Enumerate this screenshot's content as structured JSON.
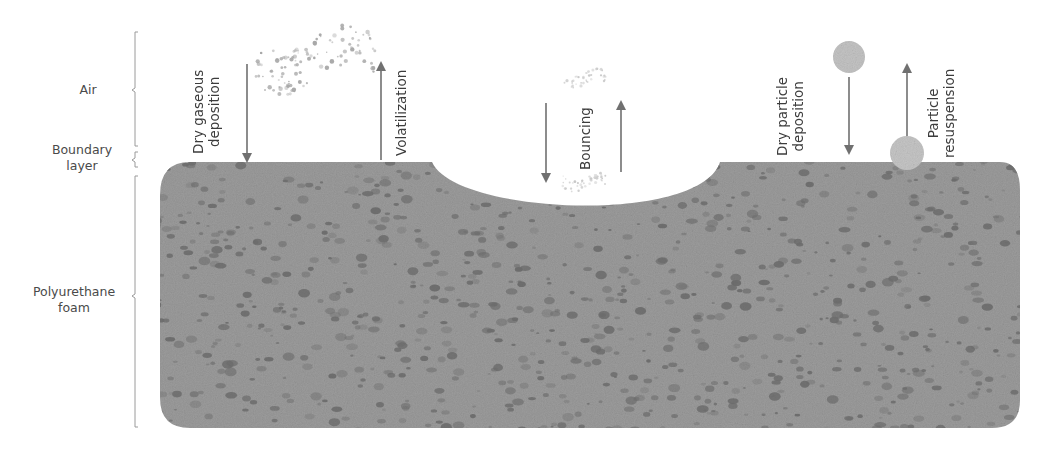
{
  "layers": [
    {
      "name": "air",
      "label": "Air"
    },
    {
      "name": "boundary-layer",
      "label": "Boundary\nlayer",
      "line1": "Boundary",
      "line2": "layer"
    },
    {
      "name": "polyurethane-foam",
      "label": "Polyurethane\nfoam",
      "line1": "Polyurethane",
      "line2": "foam"
    }
  ],
  "processes": {
    "dry_gaseous_deposition": {
      "line1": "Dry gaseous",
      "line2": "deposition",
      "direction": "down"
    },
    "volatilization": {
      "line1": "Volatilization",
      "direction": "up"
    },
    "bouncing": {
      "line1": "Bouncing",
      "direction": "down-and-up"
    },
    "dry_particle_deposition": {
      "line1": "Dry particle",
      "line2": "deposition",
      "direction": "down"
    },
    "particle_resuspension": {
      "line1": "Particle",
      "line2": "resuspension",
      "direction": "up"
    }
  },
  "colors": {
    "foam": "#9c9c9c",
    "foam_pore": "#5a5a5a",
    "arrow": "#707070",
    "particle": "#c4c4c4",
    "gas_dot": "#a8a8a8",
    "bracket": "#9a9a9a"
  }
}
